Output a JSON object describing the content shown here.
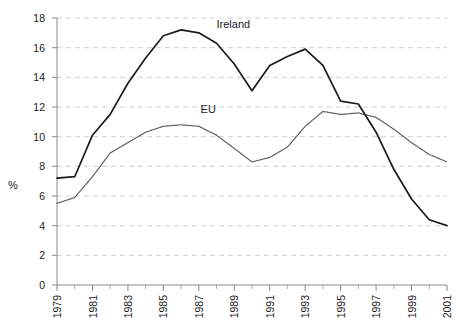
{
  "chart_data": {
    "type": "line",
    "title": "",
    "subtitle": "",
    "xlabel": "",
    "ylabel": "%",
    "ylim": [
      0,
      18
    ],
    "xlim": [
      1979,
      2001
    ],
    "yticks": [
      0,
      2,
      4,
      6,
      8,
      10,
      12,
      14,
      16,
      18
    ],
    "ytick_labels": [
      "0",
      "2",
      "4",
      "6",
      "8",
      "10",
      "12",
      "14",
      "16",
      "18"
    ],
    "x": [
      1979,
      1980,
      1981,
      1982,
      1983,
      1984,
      1985,
      1986,
      1987,
      1988,
      1989,
      1990,
      1991,
      1992,
      1993,
      1994,
      1995,
      1996,
      1997,
      1998,
      1999,
      2000,
      2001
    ],
    "xtick_labels": [
      "1979",
      "1981",
      "1983",
      "1985",
      "1987",
      "1989",
      "1991",
      "1993",
      "1995",
      "1997",
      "1999",
      "2001"
    ],
    "xticks_major": [
      1979,
      1981,
      1983,
      1985,
      1987,
      1989,
      1991,
      1993,
      1995,
      1997,
      1999,
      2001
    ],
    "grid": true,
    "grid_axis": "y",
    "legend_position": "inline-annotation",
    "series": [
      {
        "name": "Ireland",
        "style": "solid",
        "color": "#1b1b1b",
        "values": [
          7.2,
          7.3,
          10.1,
          11.5,
          13.6,
          15.3,
          16.8,
          17.2,
          17.0,
          16.3,
          14.9,
          13.1,
          14.8,
          15.4,
          15.9,
          14.8,
          12.4,
          12.2,
          10.3,
          7.8,
          5.8,
          4.4,
          4.0
        ]
      },
      {
        "name": "EU",
        "style": "dotted",
        "color": "#5d5d5d",
        "values": [
          5.5,
          5.9,
          7.3,
          8.9,
          9.6,
          10.3,
          10.7,
          10.8,
          10.7,
          10.1,
          9.2,
          8.3,
          8.6,
          9.3,
          10.7,
          11.7,
          11.5,
          11.6,
          11.3,
          10.5,
          9.6,
          8.8,
          8.3
        ]
      }
    ],
    "annotations": [
      {
        "text": "Ireland",
        "x": 1988,
        "y": 17.3
      },
      {
        "text": "EU",
        "x": 1987.1,
        "y": 11.6
      }
    ]
  },
  "axes": {
    "y_axis_title": "%"
  }
}
